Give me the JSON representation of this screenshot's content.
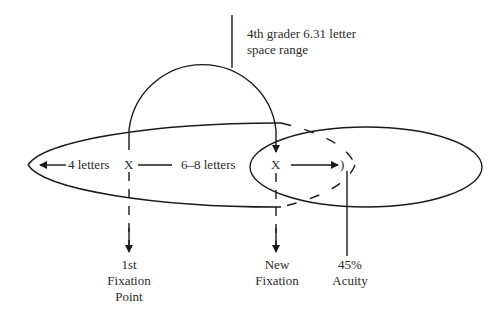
{
  "diagram": {
    "title_annotation": {
      "line1": "4th grader 6.31 letter",
      "line2": "space range"
    },
    "perceptual_span": {
      "left_label": "4 letters",
      "right_label": "6–8 letters"
    },
    "fixations": {
      "first_marker": "X",
      "new_marker": "X",
      "acuity_marker": ")"
    },
    "bottom_labels": {
      "first_fixation": {
        "line1": "1st",
        "line2": "Fixation",
        "line3": "Point"
      },
      "new_fixation": {
        "line1": "New",
        "line2": "Fixation"
      },
      "acuity": {
        "line1": "45%",
        "line2": "Acuity"
      }
    },
    "colors": {
      "stroke": "#1a1a1a",
      "text": "#2a2a2a",
      "background": "#ffffff"
    }
  }
}
